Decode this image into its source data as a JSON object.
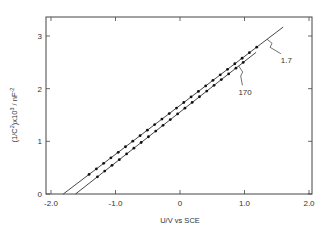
{
  "chart_data": {
    "type": "line",
    "title": "",
    "xlabel": "U/V vs SCE",
    "ylabel": "(1/C²)x10³ / nF⁻²",
    "ylabel_parts": {
      "base": "(1/C",
      "sup1": "2",
      "mid": ")x10",
      "sup2": "3",
      "unit": " / nF",
      "sup3": "-2"
    },
    "xlim": [
      -2.0,
      2.0
    ],
    "ylim": [
      0,
      3.3
    ],
    "x_ticks": [
      -2.0,
      -1.0,
      0,
      1.0,
      2.0
    ],
    "x_tick_labels": [
      "-2.0",
      "-1.0",
      "0",
      "1.0",
      "2.0"
    ],
    "y_ticks": [
      0,
      1,
      2,
      3
    ],
    "y_tick_labels": [
      "0",
      "1",
      "2",
      "3"
    ],
    "grid": false,
    "legend": "inline annotations with leader lines",
    "series": [
      {
        "name": "1.7",
        "line": {
          "x0": -1.81,
          "y0": 0,
          "x1": 1.6,
          "y1": 3.17
        },
        "marker_range": [
          -1.41,
          1.3
        ],
        "marker_step": 0.113,
        "label_pos": {
          "x": 1.47,
          "y": 2.55
        }
      },
      {
        "name": "170",
        "line": {
          "x0": -1.62,
          "y0": 0,
          "x1": 1.18,
          "y1": 2.69
        },
        "marker_range": [
          -1.28,
          1.06
        ],
        "marker_step": 0.113,
        "label_pos": {
          "x": 1.03,
          "y": 1.95
        }
      }
    ]
  }
}
